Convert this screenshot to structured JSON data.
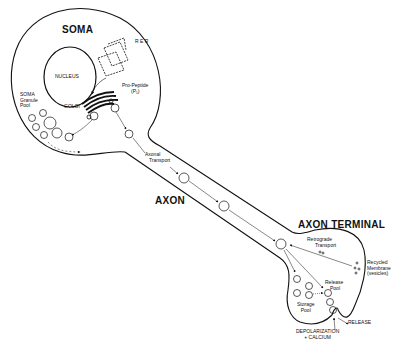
{
  "diagram": {
    "regions": {
      "soma": "SOMA",
      "axon": "AXON",
      "axon_terminal": "AXON TERMINAL"
    },
    "organelles": {
      "rer": "R E R",
      "nucleus": "NUCLEUS",
      "golgi": "GOLGI"
    },
    "labels": {
      "pro_peptide_line1": "Pro-Peptide",
      "pro_peptide_line2": "(P₁)",
      "soma_granule_line1": "SOMA",
      "soma_granule_line2": "Granule",
      "soma_granule_line3": "Pool",
      "axonal_transport_line1": "Axonal",
      "axonal_transport_line2": "Transport",
      "retrograde_line1": "Retrograde",
      "retrograde_line2": "Transport",
      "recycled_line1": "Recycled",
      "recycled_line2": "Membrane",
      "recycled_line3": "(vesicles)",
      "release_pool_line1": "Release",
      "release_pool_line2": "Pool",
      "storage_pool_line1": "Storage",
      "storage_pool_line2": "Pool",
      "release": "RELEASE",
      "depolarization_line1": "DEPOLARIZATION",
      "depolarization_line2": "+ CALCIUM"
    },
    "vesicle_labels": {
      "p1": "P₁",
      "p2": "P₂",
      "pn": "Pₙ"
    },
    "colors": {
      "ink": "#111111",
      "background": "#ffffff"
    }
  }
}
